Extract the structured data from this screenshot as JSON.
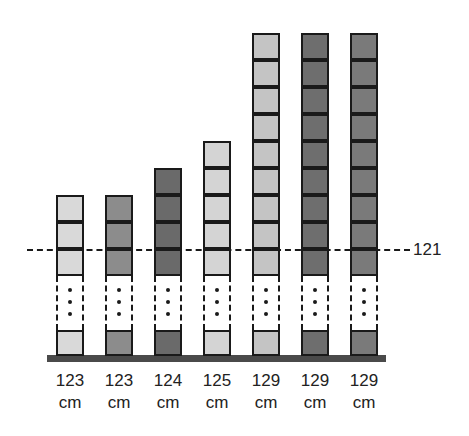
{
  "chart_data": {
    "type": "bar",
    "title": "",
    "categories": [
      "123 cm",
      "123 cm",
      "124 cm",
      "125 cm",
      "129 cm",
      "129 cm",
      "129 cm"
    ],
    "values": [
      123,
      123,
      124,
      125,
      129,
      129,
      129
    ],
    "unit": "cm",
    "reference_line": {
      "value": 121,
      "label": "121",
      "style": "dash-dot"
    },
    "axis_break": true,
    "colors": [
      "#d9d9d9",
      "#8c8c8c",
      "#6a6a6a",
      "#d4d4d4",
      "#c4c4c4",
      "#6e6e6e",
      "#7a7a7a"
    ]
  },
  "reference": {
    "label": "121"
  },
  "columns": [
    {
      "value": "123",
      "unit": "cm",
      "boxes_above_break": 3,
      "color": "#d9d9d9",
      "left": 56
    },
    {
      "value": "123",
      "unit": "cm",
      "boxes_above_break": 3,
      "color": "#8c8c8c",
      "left": 105
    },
    {
      "value": "124",
      "unit": "cm",
      "boxes_above_break": 4,
      "color": "#6a6a6a",
      "left": 154
    },
    {
      "value": "125",
      "unit": "cm",
      "boxes_above_break": 5,
      "color": "#d4d4d4",
      "left": 203
    },
    {
      "value": "129",
      "unit": "cm",
      "boxes_above_break": 9,
      "color": "#c4c4c4",
      "left": 252
    },
    {
      "value": "129",
      "unit": "cm",
      "boxes_above_break": 9,
      "color": "#6e6e6e",
      "left": 301
    },
    {
      "value": "129",
      "unit": "cm",
      "boxes_above_break": 9,
      "color": "#7a7a7a",
      "left": 350
    }
  ]
}
